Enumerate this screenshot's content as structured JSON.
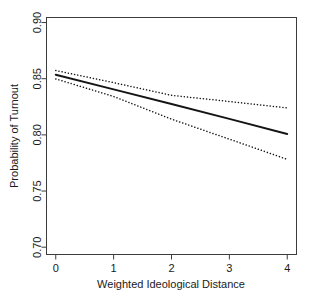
{
  "chart_data": {
    "type": "line",
    "title": "",
    "subtitle": "",
    "xlabel": "Weighted Ideological Distance",
    "ylabel": "Probability of Turnout",
    "xlim": [
      -0.16,
      4.16
    ],
    "ylim": [
      0.6935,
      0.9045
    ],
    "xticks": [
      0,
      1,
      2,
      3,
      4
    ],
    "xticklabels": [
      "0",
      "1",
      "2",
      "3",
      "4"
    ],
    "yticks": [
      0.7,
      0.75,
      0.8,
      0.85,
      0.9
    ],
    "yticklabels": [
      "0.70",
      "0.75",
      "0.80",
      "0.85",
      "0.90"
    ],
    "grid": false,
    "legend": null,
    "annotations": [],
    "x": [
      0,
      1,
      2,
      3,
      4
    ],
    "series": [
      {
        "name": "Predicted probability",
        "style": "solid",
        "color": "#141414",
        "width": 1.9,
        "values": [
          0.8535,
          0.8405,
          0.8275,
          0.8142,
          0.8008
        ]
      },
      {
        "name": "Upper 95% confidence bound",
        "style": "dotted",
        "color": "#141414",
        "width": 1.5,
        "values": [
          0.8573,
          0.8465,
          0.8352,
          0.8297,
          0.824
        ]
      },
      {
        "name": "Lower 95% confidence bound",
        "style": "dotted",
        "color": "#141414",
        "width": 1.5,
        "values": [
          0.8498,
          0.8342,
          0.814,
          0.7962,
          0.7782
        ]
      }
    ]
  },
  "figure": {
    "background_color": "#ffffff",
    "axis_color": "#3c3c3c",
    "text_color": "#1a1a1a"
  }
}
